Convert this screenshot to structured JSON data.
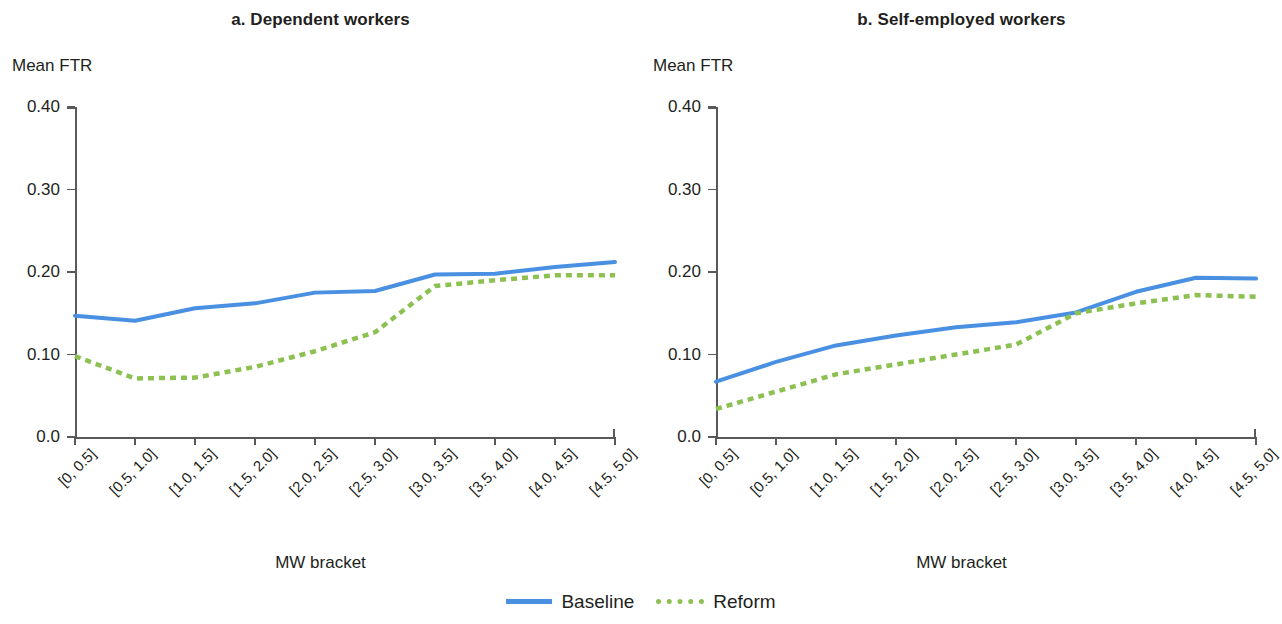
{
  "legend": {
    "items": [
      {
        "label": "Baseline",
        "style": "solid",
        "color": "#4a90e2"
      },
      {
        "label": "Reform",
        "style": "dotted",
        "color": "#8cc152"
      }
    ]
  },
  "panels": [
    {
      "title": "a. Dependent workers",
      "ylabel": "Mean FTR",
      "xlabel": "MW bracket"
    },
    {
      "title": "b. Self-employed workers",
      "ylabel": "Mean FTR",
      "xlabel": "MW bracket"
    }
  ],
  "chart_data": [
    {
      "type": "line",
      "title": "a. Dependent workers",
      "xlabel": "MW bracket",
      "ylabel": "Mean FTR",
      "categories": [
        "[0, 0.5]",
        "[0.5, 1.0]",
        "[1.0, 1.5]",
        "[1.5, 2.0]",
        "[2.0, 2.5]",
        "[2.5, 3.0]",
        "[3.0, 3.5]",
        "[3.5, 4.0]",
        "[4.0, 4.5]",
        "[4.5, 5.0]"
      ],
      "ytick_labels": [
        "0.40",
        "0.30",
        "0.20",
        "0.10",
        "0.0"
      ],
      "ytick_values": [
        0.4,
        0.3,
        0.2,
        0.1,
        0.0
      ],
      "ylim": [
        0.0,
        0.4
      ],
      "grid": false,
      "legend_position": "bottom-center",
      "series": [
        {
          "name": "Baseline",
          "color": "#4a90e2",
          "style": "solid",
          "values": [
            0.147,
            0.141,
            0.156,
            0.162,
            0.175,
            0.177,
            0.197,
            0.198,
            0.206,
            0.212
          ]
        },
        {
          "name": "Reform",
          "color": "#8cc152",
          "style": "dotted",
          "values": [
            0.098,
            0.071,
            0.072,
            0.085,
            0.104,
            0.127,
            0.183,
            0.19,
            0.196,
            0.196
          ]
        }
      ]
    },
    {
      "type": "line",
      "title": "b. Self-employed workers",
      "xlabel": "MW bracket",
      "ylabel": "Mean FTR",
      "categories": [
        "[0, 0.5]",
        "[0.5, 1.0]",
        "[1.0, 1.5]",
        "[1.5, 2.0]",
        "[2.0, 2.5]",
        "[2.5, 3.0]",
        "[3.0, 3.5]",
        "[3.5, 4.0]",
        "[4.0, 4.5]",
        "[4.5, 5.0]"
      ],
      "ytick_labels": [
        "0.40",
        "0.30",
        "0.20",
        "0.10",
        "0.0"
      ],
      "ytick_values": [
        0.4,
        0.3,
        0.2,
        0.1,
        0.0
      ],
      "ylim": [
        0.0,
        0.4
      ],
      "grid": false,
      "legend_position": "bottom-center",
      "series": [
        {
          "name": "Baseline",
          "color": "#4a90e2",
          "style": "solid",
          "values": [
            0.067,
            0.091,
            0.111,
            0.123,
            0.133,
            0.139,
            0.151,
            0.176,
            0.193,
            0.192
          ]
        },
        {
          "name": "Reform",
          "color": "#8cc152",
          "style": "dotted",
          "values": [
            0.034,
            0.055,
            0.076,
            0.088,
            0.1,
            0.112,
            0.15,
            0.162,
            0.172,
            0.17
          ]
        }
      ]
    }
  ]
}
